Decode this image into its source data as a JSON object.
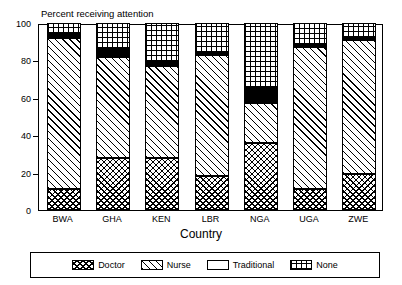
{
  "chart_data": {
    "type": "bar",
    "subtype": "stacked-bar-100",
    "title": "Percent receiving attention",
    "xlabel": "Country",
    "ylabel": "",
    "ylim": [
      0,
      100
    ],
    "yticks": [
      0,
      20,
      40,
      60,
      80,
      100
    ],
    "grid": false,
    "legend_position": "bottom",
    "categories": [
      "BWA",
      "GHA",
      "KEN",
      "LBR",
      "NGA",
      "UGA",
      "ZWE"
    ],
    "series": [
      {
        "name": "Doctor",
        "values": [
          11,
          28,
          28,
          18,
          36,
          11,
          19
        ]
      },
      {
        "name": "Nurse",
        "values": [
          81,
          54,
          49,
          65,
          21,
          76,
          72
        ]
      },
      {
        "name": "Traditional",
        "values": [
          2,
          4,
          2,
          1,
          8,
          1,
          1
        ]
      },
      {
        "name": "None",
        "values": [
          6,
          14,
          21,
          16,
          35,
          12,
          8
        ]
      }
    ],
    "cumulative_tops": {
      "Doctor": [
        11,
        28,
        28,
        18,
        36,
        11,
        19
      ],
      "Nurse": [
        92,
        82,
        77,
        83,
        57,
        87,
        91
      ],
      "Traditional": [
        94,
        86,
        79,
        84,
        65,
        88,
        92
      ],
      "None": [
        100,
        100,
        100,
        100,
        100,
        100,
        100
      ]
    },
    "patterns": {
      "Doctor": "crosshatch-diamond",
      "Nurse": "diagonal-hatch",
      "Traditional": "solid-black",
      "None": "square-grid"
    }
  },
  "axis": {
    "y_tick_labels": [
      "0",
      "20",
      "40",
      "60",
      "80",
      "100"
    ],
    "x_tick_labels": [
      "BWA",
      "GHA",
      "KEN",
      "LBR",
      "NGA",
      "UGA",
      "ZWE"
    ],
    "x_title": "Country"
  },
  "legend": {
    "entries": [
      {
        "label": "Doctor"
      },
      {
        "label": "Nurse"
      },
      {
        "label": "Traditional"
      },
      {
        "label": "None"
      }
    ]
  }
}
